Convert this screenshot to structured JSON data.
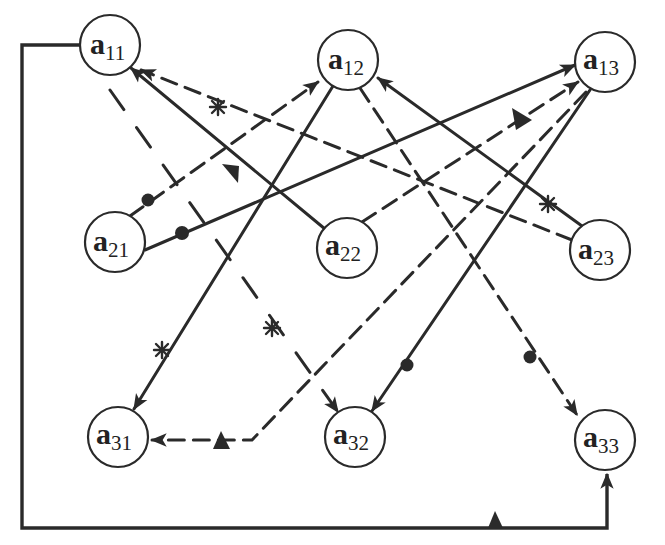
{
  "diagram": {
    "type": "directed-graph",
    "nodes": [
      {
        "id": "a11",
        "base": "a",
        "sub": "11",
        "x": 110,
        "y": 45
      },
      {
        "id": "a12",
        "base": "a",
        "sub": "12",
        "x": 348,
        "y": 60
      },
      {
        "id": "a13",
        "base": "a",
        "sub": "13",
        "x": 605,
        "y": 62
      },
      {
        "id": "a21",
        "base": "a",
        "sub": "21",
        "x": 115,
        "y": 242
      },
      {
        "id": "a22",
        "base": "a",
        "sub": "22",
        "x": 347,
        "y": 248
      },
      {
        "id": "a23",
        "base": "a",
        "sub": "23",
        "x": 600,
        "y": 250
      },
      {
        "id": "a31",
        "base": "a",
        "sub": "31",
        "x": 118,
        "y": 437
      },
      {
        "id": "a32",
        "base": "a",
        "sub": "32",
        "x": 355,
        "y": 437
      },
      {
        "id": "a33",
        "base": "a",
        "sub": "33",
        "x": 605,
        "y": 440
      }
    ],
    "edges": [
      {
        "from": "a11",
        "to": "a33",
        "style": "solid",
        "route": "rectangular-loop",
        "marker": "triangle"
      },
      {
        "from": "a22",
        "to": "a11",
        "style": "solid",
        "marker": "triangle"
      },
      {
        "from": "a23",
        "to": "a11",
        "style": "dashed",
        "marker": "star"
      },
      {
        "from": "a11",
        "to": "a32",
        "style": "long-dashed",
        "marker": "star"
      },
      {
        "from": "a21",
        "to": "a12",
        "style": "dashed",
        "marker": "dot"
      },
      {
        "from": "a21",
        "to": "a13",
        "style": "solid",
        "marker": "dot"
      },
      {
        "from": "a22",
        "to": "a13",
        "style": "dashed",
        "marker": "triangle"
      },
      {
        "from": "a12",
        "to": "a31",
        "style": "solid",
        "marker": "star"
      },
      {
        "from": "a12",
        "to": "a33",
        "style": "dashed",
        "marker": "dot"
      },
      {
        "from": "a23",
        "to": "a12",
        "style": "solid",
        "marker": "star"
      },
      {
        "from": "a13",
        "to": "a32",
        "style": "solid",
        "marker": "dot"
      },
      {
        "from": "a13",
        "to": "a31",
        "style": "dashed",
        "route": "bent",
        "marker": "triangle"
      }
    ],
    "marker_legend": [
      "star",
      "dot",
      "triangle"
    ],
    "colors": {
      "ink": "#2a2a2a",
      "background": "#ffffff"
    }
  }
}
